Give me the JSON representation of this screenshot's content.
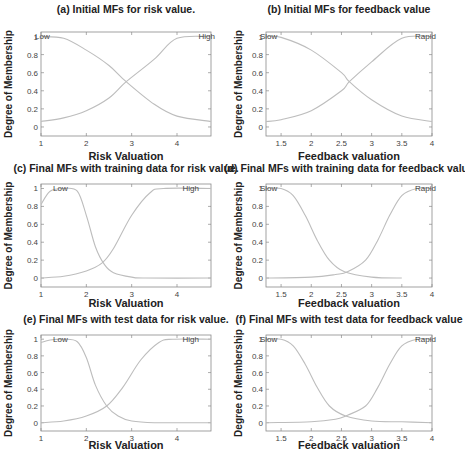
{
  "chart_data": [
    {
      "id": "a",
      "type": "line",
      "title": "(a) Initial MFs for risk value.",
      "xlabel": "Risk Valuation",
      "ylabel": "Degree of Membership",
      "xlim": [
        1,
        4.75
      ],
      "ylim": [
        -0.1,
        1.05
      ],
      "xticks": [
        1,
        2,
        3,
        4
      ],
      "xtick_labels": [
        "1",
        "2",
        "3",
        "4"
      ],
      "yticks": [
        0,
        0.2,
        0.4,
        0.6,
        0.8,
        1
      ],
      "ytick_labels": [
        "0",
        "0.2",
        "0.4",
        "0.6",
        "0.8",
        "1"
      ],
      "grid": false,
      "series": [
        {
          "name": "Low",
          "shape": "zmf-sigmoid",
          "params": {
            "center": 2.88,
            "slope": -2.0
          },
          "x": [
            1,
            1.5,
            2,
            2.5,
            2.88,
            3.5,
            4,
            4.75
          ],
          "values": [
            1.0,
            0.98,
            0.85,
            0.68,
            0.5,
            0.25,
            0.12,
            0.06
          ]
        },
        {
          "name": "High",
          "shape": "smf-sigmoid",
          "params": {
            "center": 2.88,
            "slope": 2.0
          },
          "x": [
            1,
            1.5,
            2,
            2.5,
            2.88,
            3.5,
            4,
            4.75
          ],
          "values": [
            0.06,
            0.1,
            0.18,
            0.32,
            0.5,
            0.75,
            0.98,
            1.0
          ]
        }
      ],
      "annotations": [
        "Low",
        "High"
      ]
    },
    {
      "id": "b",
      "type": "line",
      "title": "(b) Initial MFs for feedback value",
      "xlabel": "Feedback valuation",
      "ylabel": "Degree of Membership",
      "xlim": [
        1.25,
        4.0
      ],
      "ylim": [
        -0.1,
        1.05
      ],
      "xticks": [
        1.5,
        2,
        2.5,
        3,
        3.5,
        4
      ],
      "xtick_labels": [
        "1.5",
        "2",
        "2.5",
        "3",
        "3.5",
        "4"
      ],
      "yticks": [
        0,
        0.2,
        0.4,
        0.6,
        0.8,
        1
      ],
      "ytick_labels": [
        "0",
        "0.2",
        "0.4",
        "0.6",
        "0.8",
        "1"
      ],
      "grid": false,
      "series": [
        {
          "name": "Slow",
          "shape": "zmf-sigmoid",
          "params": {
            "center": 2.63,
            "slope": -2.75
          },
          "x": [
            1.25,
            1.5,
            2,
            2.5,
            2.63,
            3,
            3.5,
            4
          ],
          "values": [
            1.0,
            0.99,
            0.85,
            0.6,
            0.5,
            0.3,
            0.12,
            0.06
          ]
        },
        {
          "name": "Rapid",
          "shape": "smf-sigmoid",
          "params": {
            "center": 2.63,
            "slope": 2.75
          },
          "x": [
            1.25,
            1.5,
            2,
            2.5,
            2.63,
            3,
            3.5,
            4
          ],
          "values": [
            0.06,
            0.08,
            0.18,
            0.4,
            0.5,
            0.72,
            0.98,
            1.0
          ]
        }
      ],
      "annotations": [
        "Slow",
        "Rapid"
      ]
    },
    {
      "id": "c",
      "type": "line",
      "title": "(c) Final MFs with training data for risk value.",
      "xlabel": "Risk Valuation",
      "ylabel": "Degree of Membership",
      "xlim": [
        1,
        4.75
      ],
      "ylim": [
        -0.1,
        1.05
      ],
      "xticks": [
        1,
        2,
        3,
        4
      ],
      "xtick_labels": [
        "1",
        "2",
        "3",
        "4"
      ],
      "yticks": [
        0,
        0.2,
        0.4,
        0.6,
        0.8,
        1
      ],
      "ytick_labels": [
        "0",
        "0.2",
        "0.4",
        "0.6",
        "0.8",
        "1"
      ],
      "grid": false,
      "series": [
        {
          "name": "Low",
          "shape": "gbell",
          "x": [
            1,
            1.2,
            1.5,
            1.8,
            2.0,
            2.2,
            2.4,
            2.6,
            3.0,
            3.3,
            4.75
          ],
          "values": [
            0.82,
            0.97,
            1.0,
            0.97,
            0.7,
            0.35,
            0.15,
            0.06,
            0.01,
            0.0,
            0.0
          ]
        },
        {
          "name": "High",
          "shape": "smf-sigmoid",
          "x": [
            1,
            1.5,
            2,
            2.35,
            2.6,
            3.0,
            3.4,
            3.7,
            4.75
          ],
          "values": [
            0.0,
            0.02,
            0.08,
            0.17,
            0.33,
            0.7,
            0.95,
            1.0,
            1.0
          ]
        }
      ],
      "annotations": [
        "Low",
        "High"
      ]
    },
    {
      "id": "d",
      "type": "line",
      "title": "(d) Final MFs with training data for feedback value",
      "xlabel": "Feedback valuation",
      "ylabel": "Degree of Membership",
      "xlim": [
        1.25,
        4.0
      ],
      "ylim": [
        -0.1,
        1.05
      ],
      "xticks": [
        1.5,
        2,
        2.5,
        3,
        3.5,
        4
      ],
      "xtick_labels": [
        "1.5",
        "2",
        "2.5",
        "3",
        "3.5",
        "4"
      ],
      "yticks": [
        0,
        0.2,
        0.4,
        0.6,
        0.8,
        1
      ],
      "ytick_labels": [
        "0",
        "0.2",
        "0.4",
        "0.6",
        "0.8",
        "1"
      ],
      "grid": false,
      "series": [
        {
          "name": "Slow",
          "shape": "zmf-sigmoid",
          "x": [
            1.25,
            1.5,
            1.7,
            1.9,
            2.1,
            2.3,
            2.55,
            3.0,
            3.5
          ],
          "values": [
            1.0,
            1.0,
            0.92,
            0.7,
            0.42,
            0.2,
            0.07,
            0.01,
            0.0
          ]
        },
        {
          "name": "Rapid",
          "shape": "smf-sigmoid",
          "x": [
            1.25,
            2.0,
            2.4,
            2.6,
            2.9,
            3.1,
            3.3,
            3.5,
            3.75,
            4.0
          ],
          "values": [
            0.0,
            0.01,
            0.04,
            0.07,
            0.2,
            0.42,
            0.7,
            0.92,
            1.0,
            1.0
          ]
        }
      ],
      "annotations": [
        "Slow",
        "Rapid"
      ]
    },
    {
      "id": "e",
      "type": "line",
      "title": "(e) Final MFs with test data for risk value.",
      "xlabel": "Risk Valuation",
      "ylabel": "Degree of Membership",
      "xlim": [
        1,
        4.75
      ],
      "ylim": [
        -0.1,
        1.05
      ],
      "xticks": [
        1,
        2,
        3,
        4
      ],
      "xtick_labels": [
        "1",
        "2",
        "3",
        "4"
      ],
      "yticks": [
        0,
        0.2,
        0.4,
        0.6,
        0.8,
        1
      ],
      "ytick_labels": [
        "0",
        "0.2",
        "0.4",
        "0.6",
        "0.8",
        "1"
      ],
      "grid": false,
      "series": [
        {
          "name": "Low",
          "shape": "gbell",
          "x": [
            1,
            1.2,
            1.5,
            1.8,
            2.0,
            2.2,
            2.45,
            2.7,
            3.0,
            3.5,
            4.75
          ],
          "values": [
            0.96,
            0.99,
            1.0,
            0.97,
            0.78,
            0.45,
            0.2,
            0.08,
            0.02,
            0.0,
            0.0
          ]
        },
        {
          "name": "High",
          "shape": "smf-sigmoid",
          "x": [
            1,
            1.5,
            2,
            2.45,
            2.8,
            3.2,
            3.6,
            3.9,
            4.75
          ],
          "values": [
            0.0,
            0.02,
            0.08,
            0.2,
            0.42,
            0.75,
            0.96,
            1.0,
            1.0
          ]
        }
      ],
      "annotations": [
        "Low",
        "High"
      ]
    },
    {
      "id": "f",
      "type": "line",
      "title": "(f) Final MFs with test data for feedback value",
      "xlabel": "Feedback valuation",
      "ylabel": "Degree of Membership",
      "xlim": [
        1.25,
        4.0
      ],
      "ylim": [
        -0.1,
        1.05
      ],
      "xticks": [
        1.5,
        2,
        2.5,
        3,
        3.5,
        4
      ],
      "xtick_labels": [
        "1.5",
        "2",
        "2.5",
        "3",
        "3.5",
        "4"
      ],
      "yticks": [
        0,
        0.2,
        0.4,
        0.6,
        0.8,
        1
      ],
      "ytick_labels": [
        "0",
        "0.2",
        "0.4",
        "0.6",
        "0.8",
        "1"
      ],
      "grid": false,
      "series": [
        {
          "name": "Slow",
          "shape": "zmf-sigmoid",
          "x": [
            1.25,
            1.5,
            1.7,
            1.9,
            2.1,
            2.3,
            2.57,
            3.0,
            3.5,
            4.0
          ],
          "values": [
            1.0,
            1.0,
            0.92,
            0.7,
            0.42,
            0.2,
            0.08,
            0.02,
            0.01,
            0.0
          ]
        },
        {
          "name": "Rapid",
          "shape": "smf-sigmoid",
          "x": [
            1.25,
            2.0,
            2.4,
            2.57,
            2.9,
            3.1,
            3.3,
            3.5,
            3.75,
            4.0
          ],
          "values": [
            0.0,
            0.01,
            0.04,
            0.08,
            0.2,
            0.42,
            0.7,
            0.92,
            1.0,
            1.0
          ]
        }
      ],
      "annotations": [
        "Slow",
        "Rapid"
      ]
    }
  ],
  "style": {
    "curve_color": "#bdbdbd",
    "axis_color": "#8a8a8a",
    "text_color": "#222222",
    "tick_text_color": "#444444",
    "background": "#ffffff"
  }
}
